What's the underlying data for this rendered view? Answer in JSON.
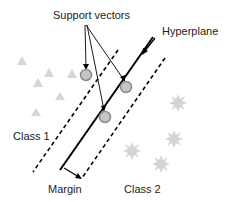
{
  "diagram": {
    "type": "svm-illustration",
    "labels": {
      "support_vectors": "Support vectors",
      "hyperplane": "Hyperplane",
      "class1": "Class 1",
      "class2": "Class 2",
      "margin": "Margin"
    },
    "colors": {
      "line": "#000000",
      "class1_marker": "#d4d4d4",
      "class2_marker": "#d4d4d4",
      "support_vector_fill": "#c8c8c8",
      "support_vector_stroke": "#8a8a8a"
    },
    "class1_points": [
      [
        22,
        62
      ],
      [
        49,
        73
      ],
      [
        72,
        75
      ],
      [
        38,
        84
      ],
      [
        58,
        97
      ],
      [
        36,
        114
      ]
    ],
    "class2_points": [
      [
        178,
        103
      ],
      [
        174,
        138
      ],
      [
        132,
        150
      ],
      [
        161,
        164
      ]
    ],
    "support_vectors": [
      [
        86,
        75
      ],
      [
        126,
        87
      ],
      [
        105,
        117
      ]
    ]
  }
}
